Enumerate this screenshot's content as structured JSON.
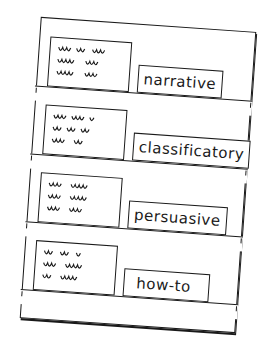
{
  "chart": {
    "name": "pocket chart of text types",
    "rows": [
      {
        "label": "narrative"
      },
      {
        "label": "classificatory"
      },
      {
        "label": "persuasive"
      },
      {
        "label": "how-to"
      }
    ]
  },
  "colors": {
    "ink": "#1a1a1a",
    "paper": "#ffffff"
  }
}
